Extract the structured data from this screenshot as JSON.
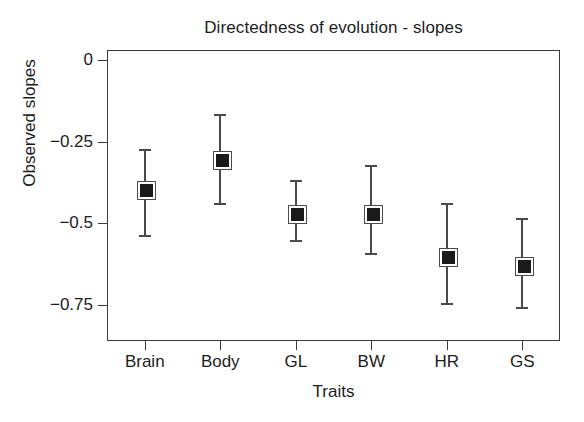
{
  "figure": {
    "title": "Directedness of evolution - slopes",
    "background_color": "#ffffff",
    "axis_color": "#3b3b3b",
    "marker_color": "#1a1a1a",
    "errorbar_color": "#4a4a4a"
  },
  "axes": {
    "x_title": "Traits",
    "y_title": "Observed slopes",
    "y_ticks": [
      "0",
      "−0.25",
      "−0.5",
      "−0.75"
    ],
    "y_tick_values": [
      0,
      -0.25,
      -0.5,
      -0.75
    ],
    "x_tick_labels": [
      "Brain",
      "Body",
      "GL",
      "BW",
      "HR",
      "GS"
    ]
  },
  "chart_data": {
    "type": "scatter",
    "title": "Directedness of evolution - slopes",
    "xlabel": "Traits",
    "ylabel": "Observed slopes",
    "categories": [
      "Brain",
      "Body",
      "GL",
      "BW",
      "HR",
      "GS"
    ],
    "values": [
      -0.394,
      -0.303,
      -0.467,
      -0.467,
      -0.597,
      -0.625
    ],
    "error_low": [
      -0.542,
      -0.444,
      -0.558,
      -0.597,
      -0.75,
      -0.761
    ],
    "error_high": [
      -0.272,
      -0.167,
      -0.367,
      -0.322,
      -0.439,
      -0.483
    ],
    "ylim": [
      -0.86,
      0.03
    ],
    "yticks": [
      0,
      -0.25,
      -0.5,
      -0.75
    ],
    "grid": false,
    "legend": false,
    "marker": "filled-square",
    "points": [
      {
        "category": "Brain",
        "value": -0.394,
        "low": -0.542,
        "high": -0.272
      },
      {
        "category": "Body",
        "value": -0.303,
        "low": -0.444,
        "high": -0.167
      },
      {
        "category": "GL",
        "value": -0.467,
        "low": -0.558,
        "high": -0.367
      },
      {
        "category": "BW",
        "value": -0.467,
        "low": -0.597,
        "high": -0.322
      },
      {
        "category": "HR",
        "value": -0.597,
        "low": -0.75,
        "high": -0.439
      },
      {
        "category": "GS",
        "value": -0.625,
        "low": -0.761,
        "high": -0.483
      }
    ]
  }
}
